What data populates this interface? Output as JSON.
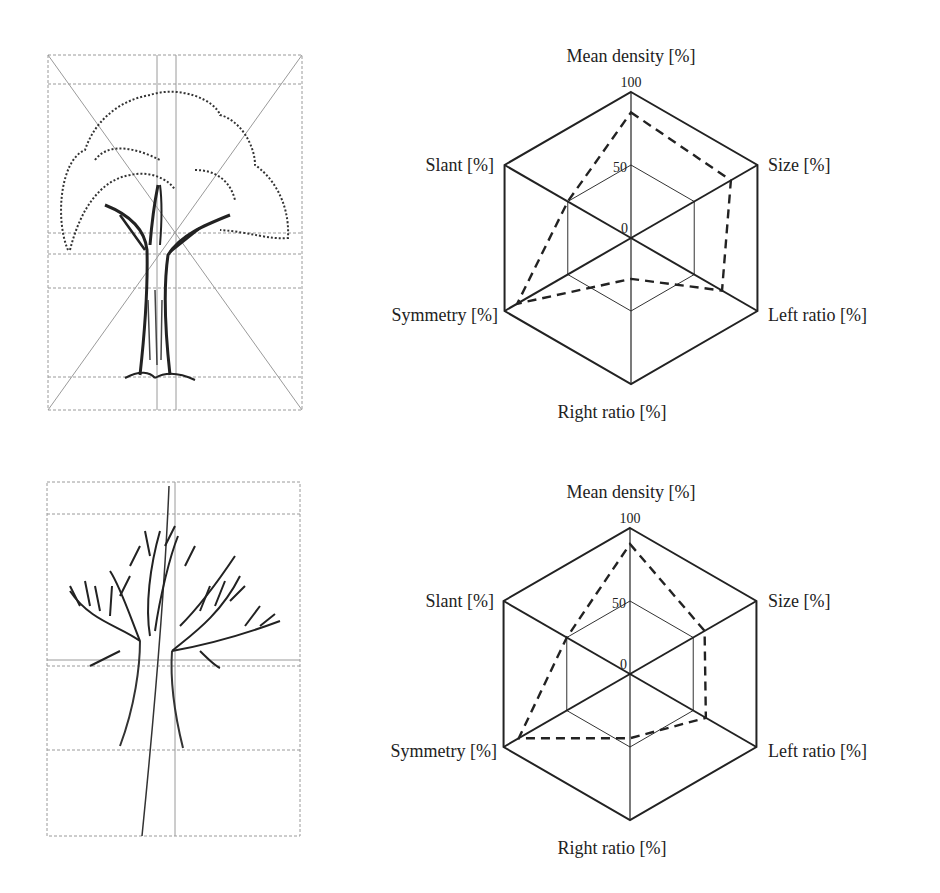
{
  "figure": {
    "panels": [
      {
        "drawing": {
          "description": "Tree drawing with dense foliage crown and grid overlay with diagonals"
        },
        "chart_index": 0
      },
      {
        "drawing": {
          "description": "Tree drawing with bare branching crown and grid overlay"
        },
        "chart_index": 1
      }
    ]
  },
  "axis_labels": {
    "top": "Mean density [%]",
    "upper_right": "Size [%]",
    "lower_right": "Left ratio [%]",
    "bottom": "Right ratio [%]",
    "lower_left": "Symmetry [%]",
    "upper_left": "Slant [%]"
  },
  "ticks": {
    "t0": "0",
    "t50": "50",
    "t100": "100"
  },
  "colors": {
    "frame": "#222222",
    "grid": "#333333",
    "series": "#222222",
    "guide": "#9a9a9a"
  },
  "chart_data": [
    {
      "type": "radar",
      "title": "",
      "axes": [
        "Mean density [%]",
        "Size [%]",
        "Left ratio [%]",
        "Right ratio [%]",
        "Symmetry [%]",
        "Slant [%]"
      ],
      "rings": [
        0,
        50,
        100
      ],
      "range": [
        0,
        100
      ],
      "series": [
        {
          "name": "Tree 1",
          "style": "dashed",
          "values": [
            86,
            79,
            72,
            28,
            90,
            50
          ]
        }
      ]
    },
    {
      "type": "radar",
      "title": "",
      "axes": [
        "Mean density [%]",
        "Size [%]",
        "Left ratio [%]",
        "Right ratio [%]",
        "Symmetry [%]",
        "Slant [%]"
      ],
      "rings": [
        0,
        50,
        100
      ],
      "range": [
        0,
        100
      ],
      "series": [
        {
          "name": "Tree 2",
          "style": "dashed",
          "values": [
            89,
            59,
            60,
            44,
            88,
            50
          ]
        }
      ]
    }
  ]
}
